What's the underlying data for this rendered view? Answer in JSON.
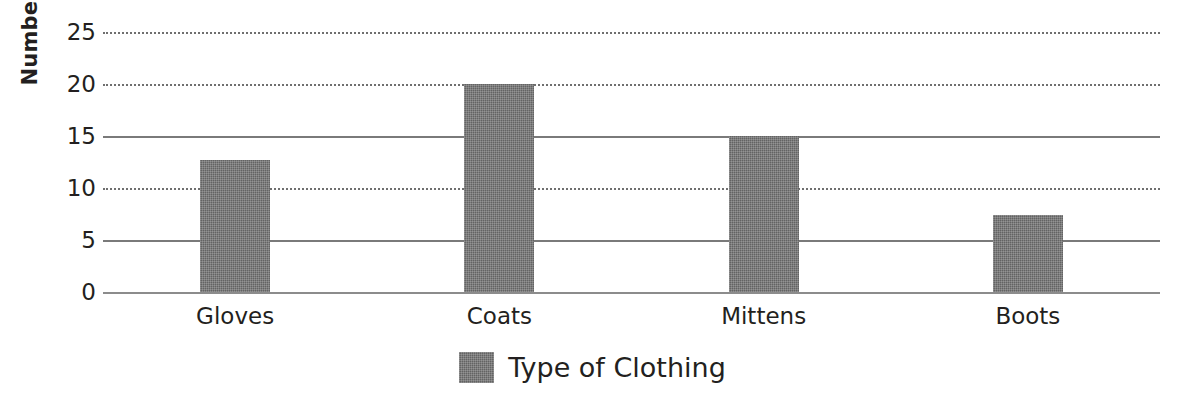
{
  "chart_data": {
    "type": "bar",
    "title": "",
    "xlabel": "",
    "ylabel": "Number of items",
    "categories": [
      "Gloves",
      "Coats",
      "Mittens",
      "Boots"
    ],
    "values": [
      12.7,
      20,
      15,
      7.4
    ],
    "series": [
      {
        "name": "Type of Clothing",
        "values": [
          12.7,
          20,
          15,
          7.4
        ],
        "color": "#636363"
      }
    ],
    "ylim": [
      0,
      25
    ],
    "y_ticks": [
      0,
      5,
      10,
      15,
      20,
      25
    ],
    "y_tick_labels": [
      "0",
      "5",
      "10",
      "15",
      "20",
      "25"
    ],
    "grid": true,
    "grid_axis": "y",
    "grid_styles": [
      "solid",
      "solid",
      "dotted",
      "solid",
      "dotted",
      "dotted"
    ],
    "legend_position": "bottom-center",
    "legend_entries": [
      {
        "label": "Type of Clothing",
        "color": "#636363"
      }
    ],
    "bar_width_px": 70,
    "background_color": "#ffffff",
    "axis_color": "#7a7a7a",
    "text_color": "#231f20"
  }
}
